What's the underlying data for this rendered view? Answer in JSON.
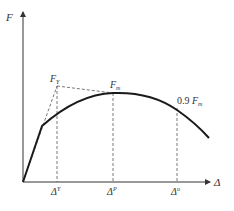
{
  "diagram": {
    "type": "force-displacement curve",
    "axes": {
      "y_label": "F",
      "x_label": "Δ"
    },
    "points": {
      "yield_force": {
        "main": "F",
        "sub": "Y"
      },
      "max_force": {
        "main": "F",
        "sub": "m"
      },
      "ultimate_force": {
        "prefix": "0.9 ",
        "main": "F",
        "sub": "m"
      }
    },
    "x_ticks": [
      {
        "main": "Δ",
        "sup": "Y"
      },
      {
        "main": "Δ",
        "sup": "P"
      },
      {
        "main": "Δ",
        "sup": "u"
      }
    ],
    "colors": {
      "curve": "#1a1a1a",
      "axes": "#333333",
      "dashed": "#555555"
    }
  }
}
